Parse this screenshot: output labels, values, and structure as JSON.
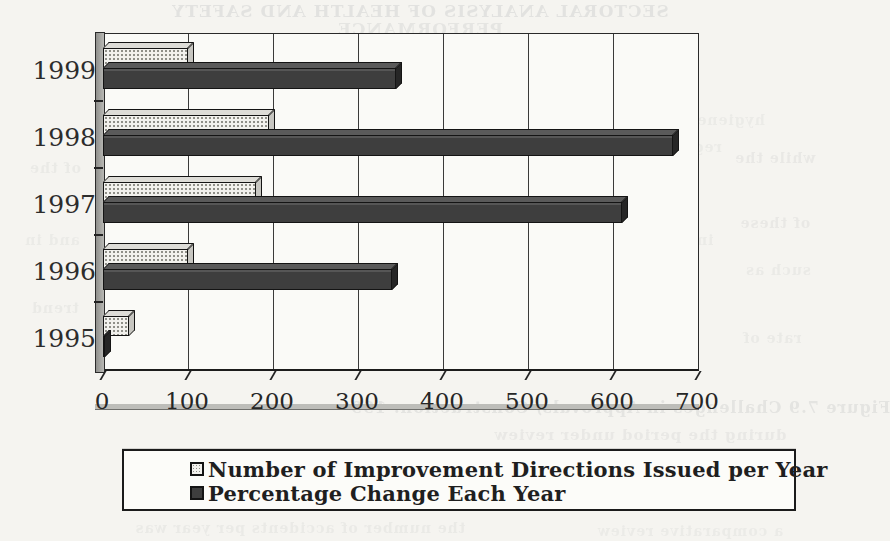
{
  "chart_data": {
    "type": "bar",
    "orientation": "horizontal",
    "categories": [
      "1999",
      "1998",
      "1997",
      "1996",
      "1995"
    ],
    "series": [
      {
        "name": "Number of Improvement Directions Issued per Year",
        "style": "stippled",
        "values": [
          100,
          195,
          180,
          100,
          30
        ]
      },
      {
        "name": "Percentage Change Each Year",
        "style": "solid-dark",
        "values": [
          345,
          670,
          610,
          340,
          0
        ]
      }
    ],
    "x_axis": {
      "min": 0,
      "max": 700,
      "ticks": [
        0,
        100,
        200,
        300,
        400,
        500,
        600,
        700
      ]
    },
    "grid": "vertical-gridlines",
    "legend_position": "bottom",
    "title": ""
  },
  "colors": {
    "paper": "#f5f4f0",
    "bar_dark": "#3e3e3e",
    "bar_light_face": "#f2f1ed",
    "axis": "#2a2a2a"
  },
  "bleed_lines": [
    {
      "text": "SECTORAL ANALYSIS OF HEALTH AND SAFETY",
      "x": 420,
      "y": 1,
      "size": 17,
      "opacity": 0.14
    },
    {
      "text": "PERFORMANCE",
      "x": 420,
      "y": 19,
      "size": 17,
      "opacity": 0.12
    },
    {
      "text": "hygiene and safety data were collected from the annual",
      "x": 520,
      "y": 112,
      "size": 14,
      "opacity": 0.07
    },
    {
      "text": "regulations were specified in 1995 under the new code",
      "x": 480,
      "y": 139,
      "size": 14,
      "opacity": 0.07
    },
    {
      "text": "initial stage and provided a remarkable increase in the",
      "x": 470,
      "y": 232,
      "size": 14,
      "opacity": 0.07
    },
    {
      "text": "report presents the overall trend",
      "x": 470,
      "y": 303,
      "size": 15,
      "opacity": 0.1
    },
    {
      "text": "while the",
      "x": 775,
      "y": 150,
      "size": 14,
      "opacity": 0.09
    },
    {
      "text": "of these",
      "x": 775,
      "y": 215,
      "size": 14,
      "opacity": 0.09
    },
    {
      "text": "such as",
      "x": 778,
      "y": 262,
      "size": 14,
      "opacity": 0.08
    },
    {
      "text": "rate of",
      "x": 772,
      "y": 330,
      "size": 14,
      "opacity": 0.08
    },
    {
      "text": "of the",
      "x": 55,
      "y": 160,
      "size": 14,
      "opacity": 0.08
    },
    {
      "text": "and in",
      "x": 52,
      "y": 232,
      "size": 14,
      "opacity": 0.07
    },
    {
      "text": "trend",
      "x": 55,
      "y": 300,
      "size": 14,
      "opacity": 0.08
    },
    {
      "text": "Figure 7.9  Challenges in Approvals, Construction: 199",
      "x": 620,
      "y": 398,
      "size": 16,
      "opacity": 0.13
    },
    {
      "text": "during the period under review",
      "x": 640,
      "y": 426,
      "size": 15,
      "opacity": 0.09
    },
    {
      "text": "the number of accidents per year was",
      "x": 300,
      "y": 520,
      "size": 14,
      "opacity": 0.08
    },
    {
      "text": "a comparative review",
      "x": 690,
      "y": 523,
      "size": 14,
      "opacity": 0.07
    }
  ]
}
